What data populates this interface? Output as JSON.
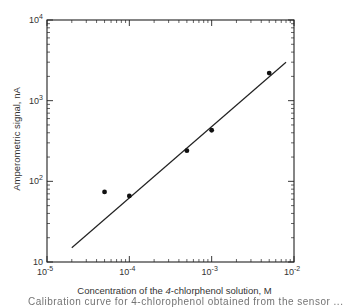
{
  "chart_data": {
    "type": "scatter",
    "title": "",
    "xlabel": "Concentration of the 4-chlorophenol solution, M",
    "xlabel_parts": {
      "pre": "Concentration of the ",
      "italic": "4",
      "post": "-chlorphenol  solution,  M"
    },
    "ylabel": "Amperometric signal,  nA",
    "xscale": "log",
    "yscale": "log",
    "xlim": [
      1e-05,
      0.01
    ],
    "ylim": [
      10,
      10000
    ],
    "grid": false,
    "legend": null,
    "x_ticks": [
      {
        "value": 1e-05,
        "label_base": "10",
        "label_exp": "-5"
      },
      {
        "value": 0.0001,
        "label_base": "10",
        "label_exp": "-4"
      },
      {
        "value": 0.001,
        "label_base": "10",
        "label_exp": "-3"
      },
      {
        "value": 0.01,
        "label_base": "10",
        "label_exp": "-2"
      }
    ],
    "y_ticks": [
      {
        "value": 10,
        "label_base": "10",
        "label_exp": ""
      },
      {
        "value": 100,
        "label_base": "10",
        "label_exp": "2"
      },
      {
        "value": 1000,
        "label_base": "10",
        "label_exp": "3"
      },
      {
        "value": 10000,
        "label_base": "10",
        "label_exp": "4"
      }
    ],
    "series": [
      {
        "name": "measured",
        "type": "scatter",
        "x": [
          5e-05,
          0.0001,
          0.0005,
          0.001,
          0.005
        ],
        "y": [
          74,
          66,
          240,
          430,
          2200
        ]
      },
      {
        "name": "fit",
        "type": "line",
        "x": [
          2e-05,
          0.008
        ],
        "y": [
          15,
          3000
        ]
      }
    ]
  },
  "caption_fragment": "Calibration curve for 4-chlorophenol obtained from the sensor ..."
}
